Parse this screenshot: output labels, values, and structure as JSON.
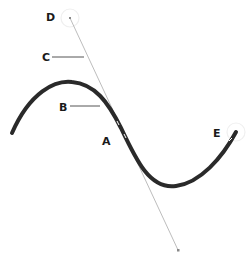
{
  "diagram": {
    "labels": {
      "A": "A",
      "B": "B",
      "C": "C",
      "D": "D",
      "E": "E"
    },
    "colors": {
      "curve": "#2a2a2a",
      "handle_line": "#bdbdbd",
      "leader": "#555555",
      "label": "#1a1a1a",
      "handle_circle": "#eeeeee"
    }
  }
}
